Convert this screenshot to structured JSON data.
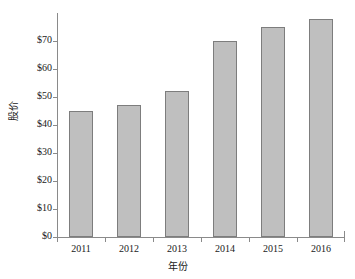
{
  "chart_data": {
    "type": "bar",
    "title": "",
    "subtitle": "",
    "xlabel": "年份",
    "ylabel": "股价",
    "categories": [
      "2011",
      "2012",
      "2013",
      "2014",
      "2015",
      "2016"
    ],
    "values": [
      45,
      47,
      52,
      70,
      75,
      78
    ],
    "series": [
      {
        "name": "股价",
        "values": [
          45,
          47,
          52,
          70,
          75,
          78
        ]
      }
    ],
    "ylim": [
      0,
      80
    ],
    "ytick_values": [
      0,
      10,
      20,
      30,
      40,
      50,
      60,
      70
    ],
    "ytick_labels": [
      "$0",
      "$10",
      "$20",
      "$30",
      "$40",
      "$50",
      "$60",
      "$70"
    ],
    "xtick_labels": [
      "2011",
      "2012",
      "2013",
      "2014",
      "2015",
      "2016"
    ],
    "grid": false,
    "legend": false,
    "legend_position": "none",
    "annotations": [],
    "colors": {
      "bar_fill": "#bfbfbf",
      "bar_border": "#7d7d7d",
      "axis": "#8a8a8a",
      "text": "#1a1a1a",
      "background": "#ffffff"
    }
  }
}
